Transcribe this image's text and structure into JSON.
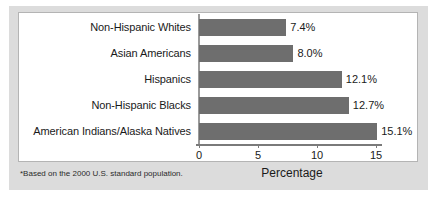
{
  "chart_data": {
    "type": "bar",
    "orientation": "horizontal",
    "title": "",
    "xlabel": "Percentage",
    "ylabel": "",
    "xlim": [
      0,
      18.5
    ],
    "xticks": [
      "0",
      "5",
      "10",
      "15"
    ],
    "xtick_values": [
      0,
      5,
      10,
      15
    ],
    "grid": false,
    "legend": false,
    "categories": [
      "Non-Hispanic Whites",
      "Asian Americans",
      "Hispanics",
      "Non-Hispanic Blacks",
      "American Indians/Alaska Natives"
    ],
    "values": [
      7.4,
      8.0,
      12.1,
      12.7,
      15.1
    ],
    "value_labels": [
      "7.4%",
      "8.0%",
      "12.1%",
      "12.7%",
      "15.1%"
    ],
    "bar_color": "#6e6e6e",
    "panel_color": "#ffffff",
    "mount_color": "#dcdcdc",
    "axis_color": "#7a7a7a",
    "footnote": "*Based on the 2000 U.S. standard population."
  }
}
